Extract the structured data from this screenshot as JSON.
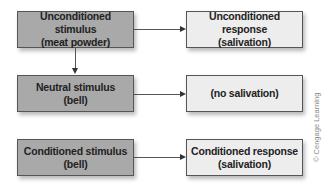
{
  "diagram": {
    "colors": {
      "stimulus_fill": "#a9a9a9",
      "response_fill": "#ededed",
      "border": "#555555",
      "arrow": "#333333"
    },
    "rows": [
      {
        "stimulus": {
          "line1": "Unconditioned stimulus",
          "line2": "(meat powder)"
        },
        "response": {
          "line1": "Unconditioned response",
          "line2": "(salivation)"
        }
      },
      {
        "stimulus": {
          "line1": "Neutral stimulus",
          "line2": "(bell)"
        },
        "response": {
          "line1": "(no salivation)",
          "line2": ""
        }
      },
      {
        "stimulus": {
          "line1": "Conditioned stimulus",
          "line2": "(bell)"
        },
        "response": {
          "line1": "Conditioned response",
          "line2": "(salivation)"
        }
      }
    ],
    "edges": [
      {
        "from": "Unconditioned stimulus",
        "to": "Unconditioned response"
      },
      {
        "from": "Unconditioned stimulus",
        "to": "Neutral stimulus"
      },
      {
        "from": "Neutral stimulus",
        "to": "(no salivation)"
      },
      {
        "from": "Conditioned stimulus",
        "to": "Conditioned response"
      }
    ],
    "credit": "© Cengage Learning"
  }
}
